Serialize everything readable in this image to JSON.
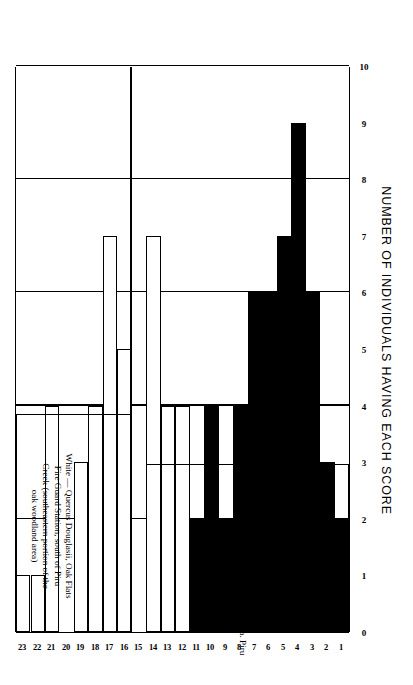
{
  "figure": {
    "value_axis_title": "NUMBER OF INDIVIDUALS HAVING EACH SCORE",
    "score_axis_title": "POINT SCORES",
    "black_oak_caption": "Black — Quercus. The taxon californica. Piru Creek,\nCalifornia.",
    "white_oak_caption": "White — Quercus Douglasii, Oak Flats\nFire Guard Station, south of Piru\nCreek (southeastern portion of the\noak woodland area)",
    "ink": "#000000",
    "paper": "#ffffff"
  },
  "chart_data": {
    "type": "bar",
    "title": "",
    "orientation": "horizontal-printed-rotated",
    "xlabel": "POINT SCORES",
    "ylabel": "NUMBER OF INDIVIDUALS HAVING EACH SCORE",
    "ylim": [
      0,
      10
    ],
    "yticks": [
      0,
      1,
      2,
      3,
      4,
      5,
      6,
      7,
      8,
      9,
      10
    ],
    "gridlines_at": [
      2,
      4,
      6,
      8,
      10
    ],
    "grid": true,
    "legend": [
      "Black — Quercus. The taxon californica",
      "White — Quercus Douglasii"
    ],
    "legend_position": "inline-panel-captions",
    "categories": [
      1,
      2,
      3,
      4,
      5,
      6,
      7,
      8,
      9,
      10,
      11,
      12,
      13,
      14,
      15,
      16,
      17,
      18,
      19,
      20,
      21,
      22,
      23
    ],
    "tick_labels": [
      "1",
      "2",
      "3",
      "4",
      "5",
      "6",
      "7",
      "8",
      "9",
      "10",
      "11",
      "12",
      "13",
      "14",
      "15",
      "16",
      "17",
      "18",
      "19",
      "20",
      "21",
      "22",
      "23"
    ],
    "series": [
      {
        "name": "Black oak (Quercus californica)",
        "fill": "solid",
        "color": "#000000",
        "values": [
          2,
          3,
          6,
          9,
          7,
          6,
          6,
          4,
          2,
          4,
          2,
          0,
          0,
          1,
          0,
          0,
          0,
          0,
          0,
          0,
          0,
          0,
          0
        ]
      },
      {
        "name": "White oak (Quercus Douglasii)",
        "fill": "hollow",
        "color": "#ffffff",
        "values": [
          0,
          0,
          0,
          0,
          0,
          0,
          0,
          0,
          0,
          0,
          0,
          4,
          4,
          7,
          0,
          5,
          7,
          4,
          3,
          0,
          4,
          1,
          1
        ]
      }
    ]
  }
}
